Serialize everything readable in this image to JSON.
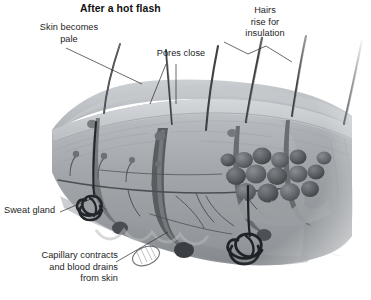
{
  "figure": {
    "title": "After a hot flash",
    "palette": {
      "background": "#ffffff",
      "text": "#1d1d1d",
      "leader_line": "#2b2b2b",
      "skin_surface": "#b9bdc1",
      "epidermis": "#c6cacd",
      "dermis": "#a9adb1",
      "hypodermis": "#9b9fa3",
      "fat_lobule": "#6e7175",
      "hair_shaft": "#3d3f42",
      "sweat_gland": "#232528",
      "capillary": "#4a4c50"
    },
    "labels": [
      {
        "id": "skin-pale",
        "name": "skin-becomes-pale",
        "lines": [
          "Skin becomes",
          "pale"
        ],
        "align": "center"
      },
      {
        "id": "pores-close",
        "name": "pores-close",
        "lines": [
          "Pores close"
        ],
        "align": "center"
      },
      {
        "id": "hairs-rise",
        "name": "hairs-rise-for-insulation",
        "lines": [
          "Hairs",
          "rise for",
          "insulation"
        ],
        "align": "center"
      },
      {
        "id": "sweat-gland",
        "name": "sweat-gland",
        "lines": [
          "Sweat gland"
        ],
        "align": "left"
      },
      {
        "id": "capillary",
        "name": "capillary-contracts",
        "lines": [
          "Capillary contracts",
          "and blood drains",
          "from skin"
        ],
        "align": "right"
      }
    ],
    "label_text": {
      "skin_pale": "Skin becomes\npale",
      "pores_close": "Pores close",
      "hairs_rise": "Hairs\nrise for\ninsulation",
      "sweat_gland": "Sweat gland",
      "capillary": "Capillary contracts\nand blood drains\nfrom skin"
    },
    "structures": [
      "hair shaft",
      "hair follicle",
      "arrector pili muscle",
      "sebaceous gland",
      "sweat gland",
      "capillary network",
      "nerve ending",
      "fat lobule",
      "epidermis",
      "dermis",
      "subcutaneous layer"
    ]
  }
}
